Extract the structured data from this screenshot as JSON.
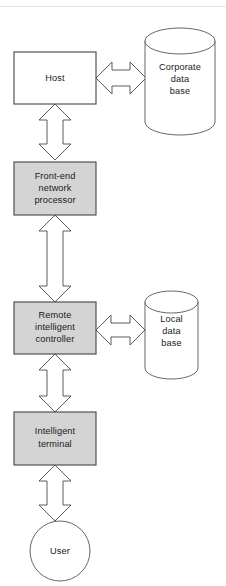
{
  "diagram": {
    "background_color": "#ffffff",
    "shaded_fill": "#d4d4d4",
    "plain_fill": "#ffffff",
    "outline_color": "#444444",
    "nodes": [
      {
        "id": "host",
        "label": "Host",
        "lines": [
          "Host"
        ],
        "shape": "rectangle",
        "fill": "plain"
      },
      {
        "id": "corporate-database",
        "label": "Corporate data base",
        "lines": [
          "Corporate",
          "data",
          "base"
        ],
        "shape": "cylinder",
        "fill": "plain"
      },
      {
        "id": "front-end-network-processor",
        "label": "Front-end network processor",
        "lines": [
          "Front-end",
          "network",
          "processor"
        ],
        "shape": "rectangle",
        "fill": "shaded"
      },
      {
        "id": "remote-intelligent-controller",
        "label": "Remote intelligent controller",
        "lines": [
          "Remote",
          "intelligent",
          "controller"
        ],
        "shape": "rectangle",
        "fill": "shaded"
      },
      {
        "id": "local-database",
        "label": "Local data base",
        "lines": [
          "Local",
          "data",
          "base"
        ],
        "shape": "cylinder",
        "fill": "plain"
      },
      {
        "id": "intelligent-terminal",
        "label": "Intelligent terminal",
        "lines": [
          "Intelligent",
          "terminal"
        ],
        "shape": "rectangle",
        "fill": "shaded"
      },
      {
        "id": "user",
        "label": "User",
        "lines": [
          "User"
        ],
        "shape": "circle",
        "fill": "plain"
      }
    ],
    "connectors": [
      {
        "id": "host-to-corporate-database",
        "from": "host",
        "to": "corporate-database",
        "orientation": "horizontal",
        "style": "double-headed-block-arrow"
      },
      {
        "id": "host-to-front-end-network-processor",
        "from": "host",
        "to": "front-end-network-processor",
        "orientation": "vertical",
        "style": "double-headed-block-arrow"
      },
      {
        "id": "front-end-network-processor-to-remote-intelligent-controller",
        "from": "front-end-network-processor",
        "to": "remote-intelligent-controller",
        "orientation": "vertical",
        "style": "double-headed-block-arrow"
      },
      {
        "id": "remote-intelligent-controller-to-local-database",
        "from": "remote-intelligent-controller",
        "to": "local-database",
        "orientation": "horizontal",
        "style": "double-headed-block-arrow"
      },
      {
        "id": "remote-intelligent-controller-to-intelligent-terminal",
        "from": "remote-intelligent-controller",
        "to": "intelligent-terminal",
        "orientation": "vertical",
        "style": "double-headed-block-arrow"
      },
      {
        "id": "intelligent-terminal-to-user",
        "from": "intelligent-terminal",
        "to": "user",
        "orientation": "vertical",
        "style": "double-headed-block-arrow"
      }
    ]
  }
}
